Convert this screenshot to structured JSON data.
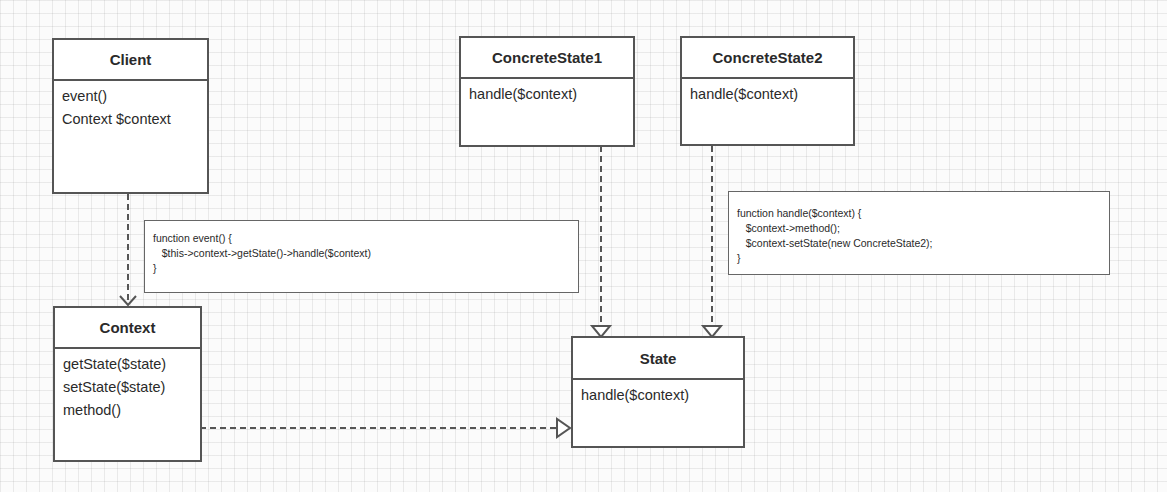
{
  "diagram": {
    "classes": {
      "client": {
        "name": "Client",
        "members": [
          "event()",
          "Context $context"
        ]
      },
      "concrete_state1": {
        "name": "ConcreteState1",
        "members": [
          "handle($context)"
        ]
      },
      "concrete_state2": {
        "name": "ConcreteState2",
        "members": [
          "handle($context)"
        ]
      },
      "context": {
        "name": "Context",
        "members": [
          "getState($state)",
          "setState($state)",
          "method()"
        ]
      },
      "state": {
        "name": "State",
        "members": [
          "handle($context)"
        ]
      }
    },
    "notes": {
      "event_note": {
        "lines": [
          "function event() {",
          "   $this->context->getState()->handle($context)",
          "}"
        ]
      },
      "handle_note": {
        "lines": [
          "function handle($context) {",
          "   $context->method();",
          "   $context-setState(new ConcreteState2);",
          "}"
        ]
      }
    },
    "relations": [
      {
        "from": "Client",
        "to": "Context",
        "type": "dependency"
      },
      {
        "from": "ConcreteState1",
        "to": "State",
        "type": "realization"
      },
      {
        "from": "ConcreteState2",
        "to": "State",
        "type": "realization"
      },
      {
        "from": "Context",
        "to": "State",
        "type": "realization"
      }
    ]
  }
}
